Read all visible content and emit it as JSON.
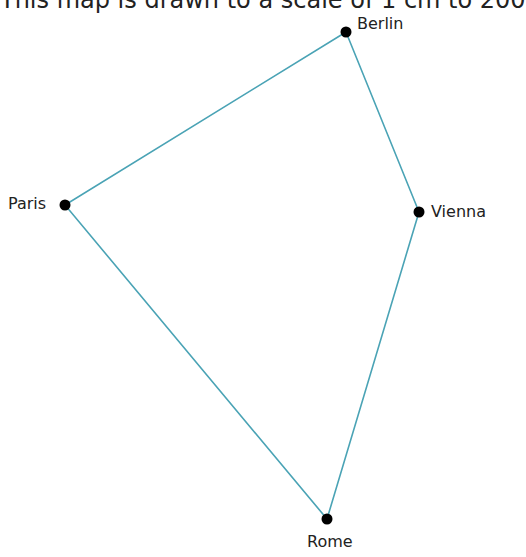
{
  "caption": "This map is drawn to a scale of 1 cm to 200",
  "colors": {
    "line": "#4aa3b5",
    "dot": "#000000"
  },
  "cities": [
    {
      "name": "Berlin",
      "x": 346,
      "y": 32
    },
    {
      "name": "Paris",
      "x": 65,
      "y": 205
    },
    {
      "name": "Vienna",
      "x": 419,
      "y": 212
    },
    {
      "name": "Rome",
      "x": 327,
      "y": 519
    }
  ],
  "edges": [
    [
      "Berlin",
      "Vienna"
    ],
    [
      "Vienna",
      "Rome"
    ],
    [
      "Rome",
      "Paris"
    ],
    [
      "Paris",
      "Berlin"
    ]
  ]
}
